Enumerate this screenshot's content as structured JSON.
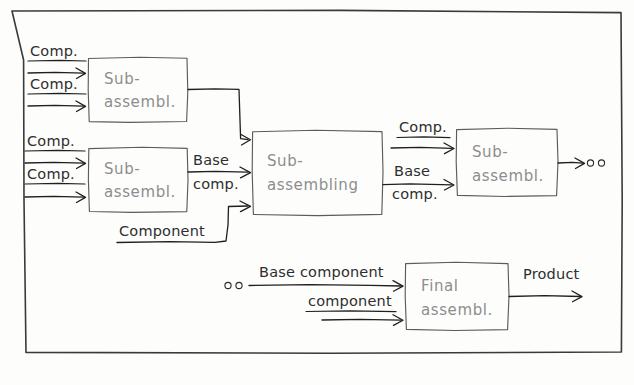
{
  "diagram": {
    "style": "hand-drawn sketch",
    "frame": {
      "label": "diagram-border"
    },
    "colors": {
      "background": "#fdfdfc",
      "frame": "#3a3a3a",
      "box_stroke": "#5c5c5c",
      "box_label": "#8d8d8d",
      "edge_label": "#2e2e2e",
      "connector": "#1f1f1f"
    },
    "nodes": [
      {
        "id": "sub1",
        "label_line1": "Sub-",
        "label_line2": "assembl.",
        "x": 88,
        "y": 57,
        "w": 99,
        "h": 65
      },
      {
        "id": "sub2",
        "label_line1": "Sub-",
        "label_line2": "assembl.",
        "x": 88,
        "y": 147,
        "w": 99,
        "h": 65
      },
      {
        "id": "subassembling",
        "label_line1": "Sub-",
        "label_line2": "assembling",
        "x": 252,
        "y": 130,
        "w": 130,
        "h": 85
      },
      {
        "id": "sub3",
        "label_line1": "Sub-",
        "label_line2": "assembl.",
        "x": 456,
        "y": 128,
        "w": 101,
        "h": 68
      },
      {
        "id": "final",
        "label_line1": "Final",
        "label_line2": "assembl.",
        "x": 405,
        "y": 262,
        "w": 103,
        "h": 68
      }
    ],
    "edge_labels": [
      {
        "id": "in1",
        "text": "Comp.",
        "x": 30,
        "y": 56
      },
      {
        "id": "in2",
        "text": "Comp.",
        "x": 30,
        "y": 89
      },
      {
        "id": "in3",
        "text": "Comp.",
        "x": 27,
        "y": 146
      },
      {
        "id": "in4",
        "text": "Comp.",
        "x": 27,
        "y": 179
      },
      {
        "id": "base_comp_1a",
        "text": "Base",
        "x": 193,
        "y": 165
      },
      {
        "id": "base_comp_1b",
        "text": "comp.",
        "x": 193,
        "y": 189
      },
      {
        "id": "component_lower",
        "text": "Component",
        "x": 119,
        "y": 236
      },
      {
        "id": "out_comp",
        "text": "Comp.",
        "x": 399,
        "y": 132
      },
      {
        "id": "out_base_a",
        "text": "Base",
        "x": 394,
        "y": 176
      },
      {
        "id": "out_base_b",
        "text": "comp.",
        "x": 392,
        "y": 199
      },
      {
        "id": "base_component_bottom",
        "text": "Base component",
        "x": 259,
        "y": 277
      },
      {
        "id": "component_bottom",
        "text": "component",
        "x": 308,
        "y": 306
      },
      {
        "id": "product",
        "text": "Product",
        "x": 523,
        "y": 279
      }
    ],
    "ellipsis_dots": [
      {
        "id": "dots-right",
        "cx1": 590,
        "cy1": 163,
        "cx2": 601,
        "cy2": 163
      },
      {
        "id": "dots-bottom",
        "cx1": 228,
        "cy1": 285,
        "cx2": 239,
        "cy2": 285
      }
    ]
  }
}
